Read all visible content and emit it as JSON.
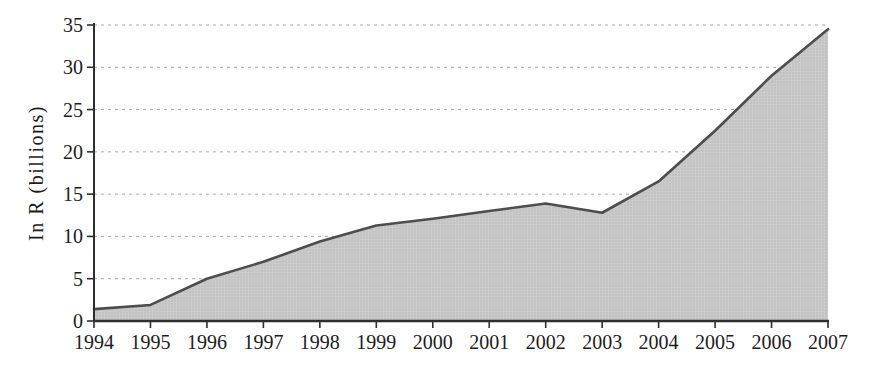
{
  "figure": {
    "kind": "scanned-area-chart"
  },
  "chart_data": {
    "type": "area",
    "x": [
      1994,
      1995,
      1996,
      1997,
      1998,
      1999,
      2000,
      2001,
      2002,
      2003,
      2004,
      2005,
      2006,
      2007
    ],
    "values": [
      1.4,
      1.9,
      5.0,
      7.0,
      9.4,
      11.3,
      12.1,
      13.0,
      13.9,
      12.8,
      16.5,
      22.5,
      29.0,
      34.5
    ],
    "series_name": "In R (billions)",
    "title": "",
    "xlabel": "",
    "ylabel": "In R (billions)",
    "ylim": [
      0,
      35
    ],
    "yticks": [
      0,
      5,
      10,
      15,
      20,
      25,
      30,
      35
    ],
    "grid": "horizontal-dashed",
    "legend": "none",
    "colors": {
      "fill": "#cacaca",
      "fill_dot": "#b7b7b7",
      "line": "#4d4d4d",
      "grid": "#a8a8a8",
      "axis": "#2e2e2e",
      "text": "#1c1c1c"
    }
  }
}
